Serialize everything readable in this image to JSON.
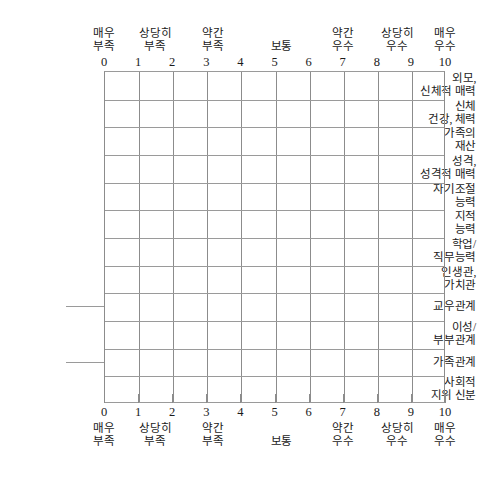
{
  "sheet": {
    "title": "",
    "background_color": "#ffffff",
    "grid_line_color": "#8c8c8c",
    "text_color": "#1a1a1a"
  },
  "scale": {
    "min": 0,
    "max": 10,
    "ticks": [
      "0",
      "1",
      "2",
      "3",
      "4",
      "5",
      "6",
      "7",
      "8",
      "9",
      "10"
    ],
    "anchors": [
      {
        "line1": "매우",
        "line2": "부족",
        "at_tick": 0
      },
      {
        "line1": "상당히",
        "line2": "부족",
        "at_tick": 1.5
      },
      {
        "line1": "약간",
        "line2": "부족",
        "at_tick": 3.2
      },
      {
        "line1": "보통",
        "line2": "",
        "at_tick": 5.2
      },
      {
        "line1": "약간",
        "line2": "우수",
        "at_tick": 7
      },
      {
        "line1": "상당히",
        "line2": "우수",
        "at_tick": 8.6
      },
      {
        "line1": "매우",
        "line2": "우수",
        "at_tick": 10
      }
    ]
  },
  "rows": [
    {
      "line1": "외모,",
      "line2": "신체적 매력"
    },
    {
      "line1": "신체",
      "line2": "건강, 체력"
    },
    {
      "line1": "가족의",
      "line2": "재산"
    },
    {
      "line1": "성격,",
      "line2": "성격적 매력"
    },
    {
      "line1": "자기조절",
      "line2": "능력"
    },
    {
      "line1": "지적",
      "line2": "능력"
    },
    {
      "line1": "학업/",
      "line2": "직무능력"
    },
    {
      "line1": "인생관,",
      "line2": "가치관"
    },
    {
      "line1": "교우관계",
      "line2": ""
    },
    {
      "line1": "이성/",
      "line2": "부부관계"
    },
    {
      "line1": "가족관계",
      "line2": ""
    },
    {
      "line1": "사회적",
      "line2": "지위 신분"
    }
  ],
  "chart_data": {
    "type": "table",
    "title": "",
    "xlabel": "",
    "ylabel": "",
    "xlim": [
      0,
      10
    ],
    "grid": true,
    "legend": "none",
    "categories": [
      "외모, 신체적 매력",
      "신체 건강, 체력",
      "가족의 재산",
      "성격, 성격적 매력",
      "자기조절 능력",
      "지적 능력",
      "학업/직무능력",
      "인생관, 가치관",
      "교우관계",
      "이성/부부관계",
      "가족관계",
      "사회적 지위 신분"
    ],
    "values": [
      null,
      null,
      null,
      null,
      null,
      null,
      null,
      null,
      null,
      null,
      null,
      null
    ],
    "x": [
      0,
      1,
      2,
      3,
      4,
      5,
      6,
      7,
      8,
      9,
      10
    ],
    "x_tick_labels": [
      "0",
      "1",
      "2",
      "3",
      "4",
      "5",
      "6",
      "7",
      "8",
      "9",
      "10"
    ],
    "annotations": [
      "매우 부족",
      "상당히 부족",
      "약간 부족",
      "보통",
      "약간 우수",
      "상당히 우수",
      "매우 우수"
    ],
    "note": "Blank self-rating grid; no data marks are plotted."
  }
}
